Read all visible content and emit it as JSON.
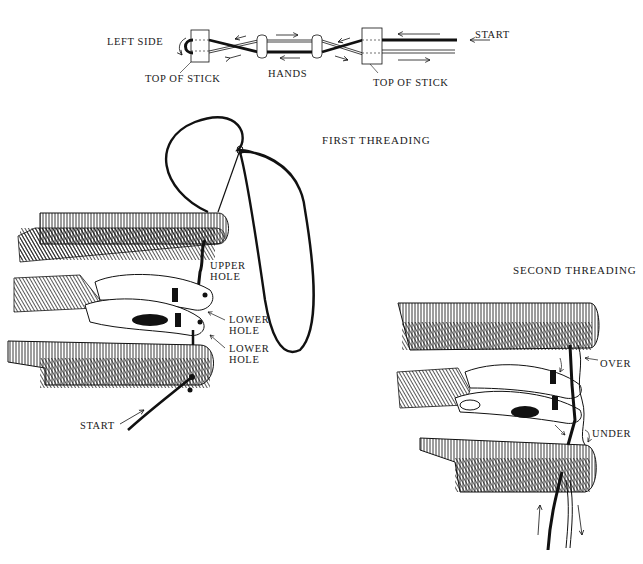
{
  "top_schematic": {
    "left_side_label": "LEFT SIDE",
    "top_of_stick_left": "TOP OF STICK",
    "hands_label": "HANDS",
    "top_of_stick_right": "TOP OF STICK",
    "start_label": "START"
  },
  "first_threading": {
    "title": "FIRST THREADING",
    "upper_hole_line1": "UPPER",
    "upper_hole_line2": "HOLE",
    "lower_hole_a_line1": "LOWER",
    "lower_hole_a_line2": "HOLE",
    "lower_hole_b_line1": "LOWER",
    "lower_hole_b_line2": "HOLE",
    "start_label": "START"
  },
  "second_threading": {
    "title": "SECOND THREADING",
    "over_label": "OVER",
    "under_label": "UNDER"
  },
  "colors": {
    "ink": "#111111",
    "paper": "#ffffff"
  }
}
